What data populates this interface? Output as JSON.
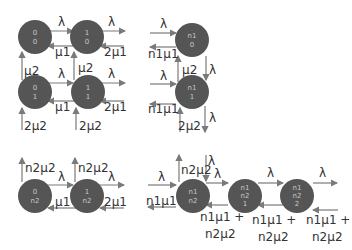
{
  "diagram": {
    "type": "state-transition",
    "panels": [
      {
        "id": "top-left",
        "nodes": [
          {
            "id": "00",
            "lines": [
              "0",
              "0"
            ]
          },
          {
            "id": "10",
            "lines": [
              "1",
              "0"
            ]
          },
          {
            "id": "01",
            "lines": [
              "0",
              "1"
            ]
          },
          {
            "id": "11",
            "lines": [
              "1",
              "1"
            ]
          }
        ],
        "labels": {
          "l1": "λ",
          "l2": "λ",
          "mu1a": "μ1",
          "two_mu1a": "2μ1",
          "mu2a": "μ2",
          "mu2b": "μ2",
          "l3": "λ",
          "l4": "λ",
          "mu1b": "μ1",
          "two_mu1b": "2μ1",
          "two_mu2a": "2μ2",
          "two_mu2b": "2μ2"
        }
      },
      {
        "id": "top-right",
        "nodes": [
          {
            "id": "n1-0",
            "lines": [
              "n1",
              "0"
            ]
          },
          {
            "id": "n1-1",
            "lines": [
              "n1",
              "1"
            ]
          }
        ],
        "labels": {
          "l1": "λ",
          "n1mu1a": "n1μ1",
          "mu2": "μ2",
          "l_down1": "λ",
          "l2": "λ",
          "n1mu1b": "n1μ1",
          "two_mu2": "2μ2",
          "l_down2": "λ"
        }
      },
      {
        "id": "bottom-left",
        "nodes": [
          {
            "id": "0-n2",
            "lines": [
              "0",
              "n2"
            ]
          },
          {
            "id": "1-n2",
            "lines": [
              "1",
              "n2"
            ]
          }
        ],
        "labels": {
          "n2mu2a": "n2μ2",
          "n2mu2b": "n2μ2",
          "l1": "λ",
          "l2": "λ",
          "mu1": "μ1",
          "two_mu1": "2μ1"
        }
      },
      {
        "id": "bottom-right",
        "nodes": [
          {
            "id": "n1-n2",
            "lines": [
              "n1",
              "n2"
            ]
          },
          {
            "id": "n1-n2-1",
            "lines": [
              "n1",
              "n2",
              "1"
            ]
          },
          {
            "id": "n1-n2-2",
            "lines": [
              "n1",
              "n2",
              "2"
            ]
          }
        ],
        "labels": {
          "l_in": "λ",
          "n1mu1": "n1μ1",
          "n2mu2": "n2μ2",
          "l_down": "λ",
          "l1": "λ",
          "l2": "λ",
          "l3": "λ",
          "back1a": "n1μ1 +",
          "back1b": "n2μ2",
          "back2a": "n1μ1 +",
          "back2b": "n2μ2",
          "back3a": "n1μ1 +",
          "back3b": "n2μ2"
        }
      }
    ]
  }
}
